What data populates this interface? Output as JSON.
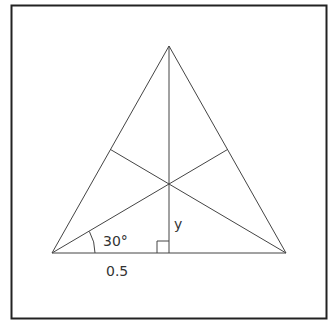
{
  "diagram": {
    "type": "equilateral-triangle",
    "frame": {
      "x": 11,
      "y": 5,
      "width": 315,
      "height": 313
    },
    "vertices": {
      "apex": [
        169,
        46
      ],
      "left": [
        52,
        253
      ],
      "right": [
        286,
        253
      ]
    },
    "centroid": [
      169,
      184
    ],
    "labels": {
      "angle": "30°",
      "height_segment": "y",
      "half_base": "0.5"
    },
    "colors": {
      "stroke": "#333333",
      "frame": "#222222",
      "background": "#ffffff"
    }
  }
}
